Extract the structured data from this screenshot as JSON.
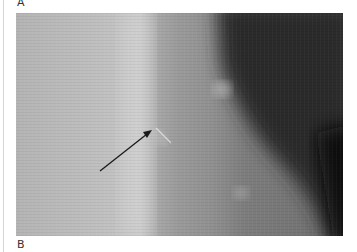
{
  "figure": {
    "panel_top_label": "A",
    "panel_bottom_label": "B",
    "image_description": "grayscale radiograph with arrow indicating finding",
    "annotation": {
      "type": "arrow",
      "icon": "arrow-icon"
    },
    "colors": {
      "arrow": "#1a1a1a",
      "background": "#ffffff"
    }
  }
}
